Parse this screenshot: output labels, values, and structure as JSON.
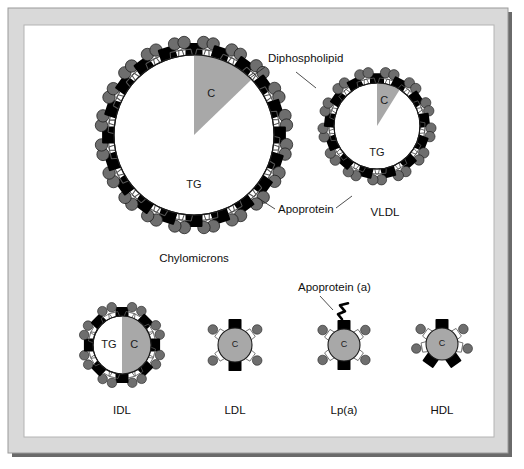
{
  "figure": {
    "background_color": "#ffffff",
    "frame": {
      "outer_fill": "#d9d9d9",
      "outer_stroke": "#9a9a9a",
      "inner_fill": "#ffffff",
      "inner_stroke": "#b4b4b4",
      "shadow_color": "#6a6a6a"
    }
  },
  "colors": {
    "core_triglyceride": "#ffffff",
    "core_cholesterol": "#a8a8a8",
    "phospholipid_head": "#6e6e6e",
    "phospholipid_tail": "#555555",
    "apoprotein": "#000000",
    "outline": "#1a1a1a",
    "text": "#101010"
  },
  "annotations": [
    {
      "id": "diphospholipid",
      "label": "Diphospholipid",
      "text_x": 268,
      "text_y": 62,
      "anchor": "start",
      "leader_points": "265,67 250,78 296,72 316,88"
    },
    {
      "id": "apoprotein",
      "label": "Apoprotein",
      "text_x": 278,
      "text_y": 213,
      "anchor": "start",
      "leader_points": "275,209 258,198 336,208 352,196"
    },
    {
      "id": "apoprotein-a",
      "label": "Apoprotein (a)",
      "text_x": 298,
      "text_y": 291,
      "anchor": "start",
      "leader_points": "320,296 333,310"
    }
  ],
  "particles": [
    {
      "id": "chylomicrons",
      "label": "Chylomicrons",
      "label_x": 194,
      "label_y": 262,
      "cx": 194,
      "cy": 135,
      "r": 80,
      "core_type": "wedge",
      "core_base_label": "TG",
      "core_base_label_dx": 0,
      "core_base_label_dy": 50,
      "wedge_label": "C",
      "wedge_label_r": 0.55,
      "wedge_start_deg": -90,
      "wedge_end_deg": -44,
      "shell_units": 20,
      "shell_rotation_deg": -90,
      "apo_size": 17,
      "head_r": 6.2,
      "label_font": 12
    },
    {
      "id": "vldl",
      "label": "VLDL",
      "label_x": 385,
      "label_y": 216,
      "cx": 377,
      "cy": 126,
      "r": 43,
      "core_type": "wedge",
      "core_base_label": "TG",
      "core_base_label_dx": 0,
      "core_base_label_dy": 27,
      "wedge_label": "C",
      "wedge_label_r": 0.6,
      "wedge_start_deg": -90,
      "wedge_end_deg": -58,
      "shell_units": 13,
      "shell_rotation_deg": -90,
      "apo_size": 14,
      "head_r": 5.2,
      "label_font": 11.5
    },
    {
      "id": "idl",
      "label": "IDL",
      "label_x": 122,
      "label_y": 414,
      "cx": 122,
      "cy": 345,
      "r": 29,
      "core_type": "half",
      "core_base_label": "TG",
      "core_base_label_dx": -13,
      "core_base_label_dy": 0,
      "wedge_label": "C",
      "wedge_label_r": 0.45,
      "wedge_start_deg": -90,
      "wedge_end_deg": 90,
      "shell_units": 8,
      "shell_rotation_deg": -90,
      "apo_size": 13,
      "head_r": 4.8,
      "label_font": 11
    },
    {
      "id": "ldl",
      "label": "LDL",
      "label_x": 235,
      "label_y": 414,
      "cx": 235,
      "cy": 345,
      "r": 17,
      "core_type": "full",
      "core_base_label": "C",
      "core_base_label_dx": 0,
      "core_base_label_dy": 0,
      "shell_units": 4,
      "shell_rotation_deg": -90,
      "apo_size": 13,
      "head_r": 4.8,
      "label_font": 11
    },
    {
      "id": "lpa",
      "label": "Lp(a)",
      "label_x": 344,
      "label_y": 414,
      "cx": 344,
      "cy": 345,
      "r": 16,
      "core_type": "full",
      "core_base_label": "C",
      "core_base_label_dx": 0,
      "core_base_label_dy": 0,
      "shell_units": 4,
      "shell_rotation_deg": -90,
      "apo_size": 13,
      "head_r": 4.8,
      "label_font": 11,
      "has_squiggle": true
    },
    {
      "id": "hdl",
      "label": "HDL",
      "label_x": 442,
      "label_y": 414,
      "cx": 442,
      "cy": 344,
      "r": 16,
      "core_type": "full",
      "core_base_label": "C",
      "core_base_label_dx": 0,
      "core_base_label_dy": 0,
      "shell_units": 4,
      "shell_rotation_deg": -90,
      "apo_size": 13,
      "head_r": 4.8,
      "label_font": 11,
      "apo_angles": [
        -90,
        55,
        125
      ],
      "head_angles": [
        -145,
        -35,
        170,
        10
      ]
    }
  ]
}
